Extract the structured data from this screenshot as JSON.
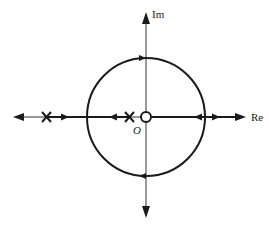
{
  "diagram": {
    "type": "root-locus",
    "axes": {
      "real_label": "Re",
      "imag_label": "Im",
      "origin_label": "O"
    },
    "colors": {
      "stroke": "#1a1a1a",
      "axis": "#333333",
      "background": "#ffffff"
    },
    "poles": [
      {
        "name": "pole-far-left",
        "marker": "x"
      },
      {
        "name": "pole-near-origin",
        "marker": "x"
      }
    ],
    "zeros": [
      {
        "name": "zero-origin",
        "marker": "o"
      }
    ],
    "locus": {
      "circle": "centered at origin, passing through imaginary axis",
      "branches": [
        "real-axis segments with arrows",
        "circular branch"
      ]
    }
  }
}
